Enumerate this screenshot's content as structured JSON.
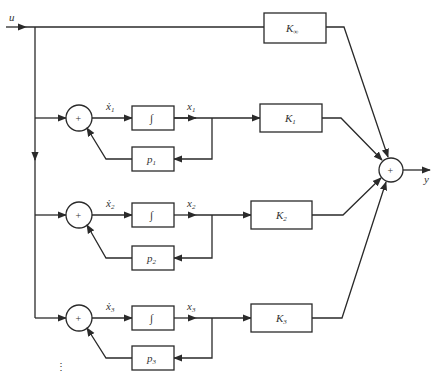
{
  "diagram": {
    "input_label": "u",
    "output_label": "y",
    "feedthrough_gain": {
      "label": "K",
      "subscript": "∞"
    },
    "sum_symbol": "+",
    "integrator_symbol": "∫",
    "branches": [
      {
        "xdot": "ẋ",
        "x": "x",
        "index": "1",
        "pole": "p",
        "gain": "K"
      },
      {
        "xdot": "ẋ",
        "x": "x",
        "index": "2",
        "pole": "p",
        "gain": "K"
      },
      {
        "xdot": "ẋ",
        "x": "x",
        "index": "3",
        "pole": "p",
        "gain": "K"
      }
    ],
    "continuation": "⋮"
  }
}
